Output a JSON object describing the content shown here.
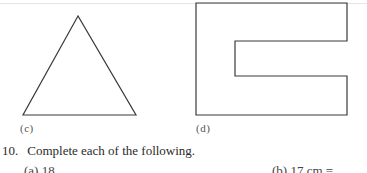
{
  "figures": [
    {
      "id": "c",
      "label": "(c)",
      "shape": "triangle"
    },
    {
      "id": "d",
      "label": "(d)",
      "shape": "c-shaped polygon"
    }
  ],
  "question": {
    "number": "10.",
    "text": "Complete each of the following."
  },
  "subparts": [
    {
      "label": "(a)",
      "text": "(a) 18"
    },
    {
      "label": "(b)",
      "text": "(b) 17 cm ="
    }
  ],
  "colors": {
    "stroke": "#3a3a3a",
    "text": "#2a2a2a"
  }
}
